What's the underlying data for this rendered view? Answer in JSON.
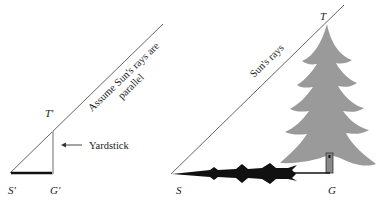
{
  "diagram": {
    "left": {
      "ray_label_line1": "Assume Sun's rays are",
      "ray_label_line2": "parallel",
      "top_label": "T'",
      "shadow_tip_label": "S'",
      "ground_label": "G'",
      "yardstick_label": "Yardstick",
      "arrow_glyph": "←"
    },
    "right": {
      "ray_label": "Sun's rays",
      "top_label": "T",
      "shadow_tip_label": "S",
      "ground_label": "G"
    },
    "colors": {
      "ray_line": "#555555",
      "tree_fill": "#9a9a9a",
      "shadow_fill": "#111111",
      "yardstick": "#b5b5b5",
      "text": "#222222"
    }
  }
}
